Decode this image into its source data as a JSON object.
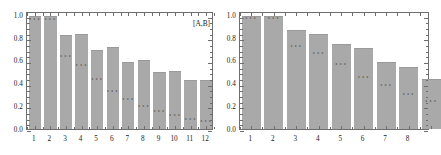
{
  "figure": {
    "panels": [
      "left",
      "right"
    ],
    "background_color": "#ffffff",
    "bar_color": "#a9a9a9",
    "frame_color": "#6e6e6e",
    "text_color": "#1a1a1a",
    "marker_glyph": "•••"
  },
  "chart_data": [
    {
      "type": "bar",
      "panel": "left",
      "title": "",
      "annotation": "[A,B]",
      "annotation_position": "top-right",
      "xlabel": "",
      "ylabel": "",
      "categories": [
        "1",
        "2",
        "3",
        "4",
        "5",
        "6",
        "7",
        "8",
        "9",
        "10",
        "11",
        "12"
      ],
      "values": [
        1.0,
        1.0,
        0.83,
        0.84,
        0.7,
        0.72,
        0.59,
        0.61,
        0.5,
        0.51,
        0.43,
        0.43
      ],
      "marker_values": [
        0.98,
        0.98,
        0.65,
        0.57,
        0.45,
        0.34,
        0.27,
        0.21,
        0.17,
        0.13,
        0.1,
        0.08
      ],
      "ylim": [
        0.0,
        1.04
      ],
      "yticks": [
        0.0,
        0.2,
        0.4,
        0.6,
        0.8,
        1.0
      ],
      "ytick_labels": [
        "0.0",
        "0.2",
        "0.4",
        "0.6",
        "0.8",
        "1.0"
      ],
      "grid": false,
      "legend": "none"
    },
    {
      "type": "bar",
      "panel": "right",
      "title": "",
      "annotation": "",
      "xlabel": "",
      "ylabel": "",
      "categories": [
        "1",
        "2",
        "3",
        "4",
        "5",
        "6",
        "7",
        "8"
      ],
      "values": [
        1.0,
        1.0,
        0.87,
        0.84,
        0.75,
        0.71,
        0.59,
        0.55,
        0.44
      ],
      "marker_values": [
        0.99,
        0.99,
        0.74,
        0.68,
        0.58,
        0.47,
        0.4,
        0.32,
        0.26
      ],
      "ylim": [
        0.0,
        1.04
      ],
      "yticks": [
        0.0,
        0.2,
        0.4,
        0.6,
        0.8,
        1.0
      ],
      "ytick_labels": [
        "0.0",
        "0.2",
        "0.4",
        "0.6",
        "0.8",
        "1.0"
      ],
      "grid": false,
      "legend": "none",
      "clipped_right": true
    }
  ]
}
